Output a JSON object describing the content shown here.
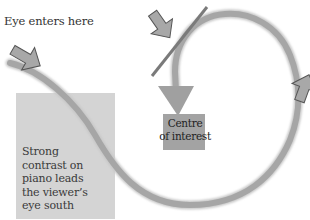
{
  "diagram": {
    "labels": {
      "entry": "Eye enters here",
      "piano_lines": [
        "Strong",
        "contrast on",
        "piano leads",
        "the viewer’s",
        "eye south"
      ],
      "centre_lines": [
        "Centre",
        "of interest"
      ]
    },
    "arrows": [
      {
        "id": "entry-arrow",
        "direction": "south-east",
        "label": "Eye enters here"
      },
      {
        "id": "top-arrow",
        "direction": "south-east",
        "note": "points toward diagonal barrier line"
      },
      {
        "id": "right-arrow",
        "direction": "north",
        "note": "on right side of loop"
      },
      {
        "id": "path-head",
        "direction": "south",
        "note": "curve terminates at centre of interest"
      }
    ],
    "colors": {
      "path": "#a6a6a6",
      "arrow_fill": "#a8a8a8",
      "arrow_stroke": "#555555",
      "barrier_line": "#7a7a7a",
      "piano_box": "#d4d4d4",
      "centre_box": "#a3a3a3",
      "text": "#333333"
    }
  }
}
